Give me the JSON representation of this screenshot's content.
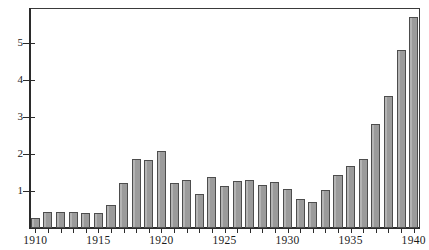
{
  "chart_data": {
    "type": "bar",
    "title": "",
    "subtitle": "",
    "xlabel": "",
    "ylabel": "",
    "categories": [
      "1910",
      "1911",
      "1912",
      "1913",
      "1914",
      "1915",
      "1916",
      "1917",
      "1918",
      "1919",
      "1920",
      "1921",
      "1922",
      "1923",
      "1924",
      "1925",
      "1926",
      "1927",
      "1928",
      "1929",
      "1930",
      "1931",
      "1932",
      "1933",
      "1934",
      "1935",
      "1936",
      "1937",
      "1938",
      "1939",
      "1940"
    ],
    "values": [
      0.28,
      0.44,
      0.42,
      0.42,
      0.4,
      0.4,
      0.62,
      1.22,
      1.87,
      1.83,
      2.08,
      1.22,
      1.29,
      0.92,
      1.37,
      1.14,
      1.27,
      1.31,
      1.15,
      1.24,
      1.05,
      0.79,
      0.71,
      1.03,
      1.43,
      1.69,
      1.87,
      2.82,
      3.58,
      4.81,
      5.72
    ],
    "xticks": [
      "1910",
      "1915",
      "1920",
      "1925",
      "1930",
      "1935",
      "1940"
    ],
    "yticks": [
      "1",
      "2",
      "3",
      "4",
      "5"
    ],
    "ylim": [
      0,
      5.95
    ],
    "grid": false,
    "legend": null,
    "bar_fill_color": "#9b9b9b",
    "bar_edge_color": "#4d4d4d",
    "axis_color": "#2b2b2b",
    "background_color": "#ffffff"
  }
}
